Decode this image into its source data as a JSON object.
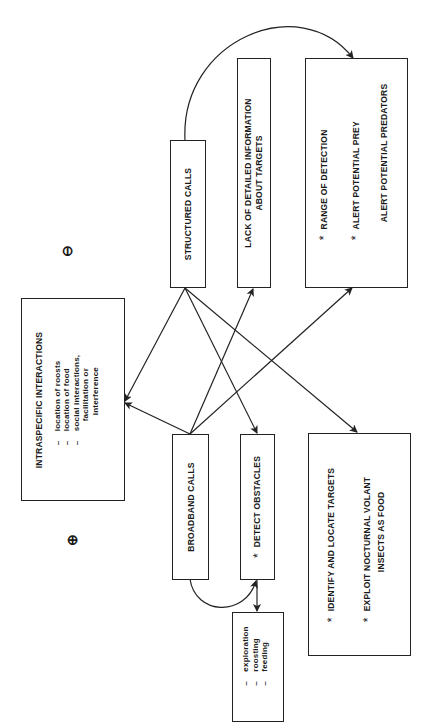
{
  "nodes": {
    "structured_calls": {
      "label": "STRUCTURED CALLS"
    },
    "broadband_calls": {
      "label": "BROADBAND CALLS"
    },
    "lack_info": {
      "lines": [
        "LACK OF DETAILED INFORMATION",
        "ABOUT TARGETS"
      ]
    },
    "range": {
      "items": [
        {
          "star": "*",
          "text": "RANGE OF DETECTION"
        },
        {
          "star": "*",
          "text": "ALERT POTENTIAL PREY"
        },
        {
          "star": "",
          "text": "ALERT POTENTIAL PREDATORS"
        }
      ]
    },
    "intraspecific": {
      "title": "INTRASPECIFIC INTERACTIONS",
      "items": [
        "location of roosts",
        "location of food",
        "social interactions,",
        "facilitation or",
        "interference"
      ],
      "dash": "–"
    },
    "detect_obstacles": {
      "star": "*",
      "text": "DETECT OBSTACLES"
    },
    "identify": {
      "items": [
        {
          "star": "*",
          "lines": [
            "IDENTIFY AND LOCATE TARGETS"
          ]
        },
        {
          "star": "*",
          "lines": [
            "EXPLOIT NOCTURNAL VOLANT",
            "INSECTS AS FOOD"
          ]
        }
      ]
    },
    "activities": {
      "items": [
        "exploration",
        "roosting",
        "feeding"
      ],
      "dash": "–"
    }
  },
  "symbols": {
    "minus": "⊖",
    "plus": "⊕"
  },
  "edges": [
    {
      "from": "structured_calls",
      "to": "range"
    },
    {
      "from": "structured_calls",
      "to": "intraspecific"
    },
    {
      "from": "structured_calls",
      "to": "detect_obstacles"
    },
    {
      "from": "structured_calls",
      "to": "identify"
    },
    {
      "from": "broadband_calls",
      "to": "intraspecific"
    },
    {
      "from": "broadband_calls",
      "to": "lack_info"
    },
    {
      "from": "broadband_calls",
      "to": "range"
    },
    {
      "from": "broadband_calls",
      "to": "detect_obstacles"
    },
    {
      "from": "detect_obstacles",
      "to": "activities"
    }
  ]
}
